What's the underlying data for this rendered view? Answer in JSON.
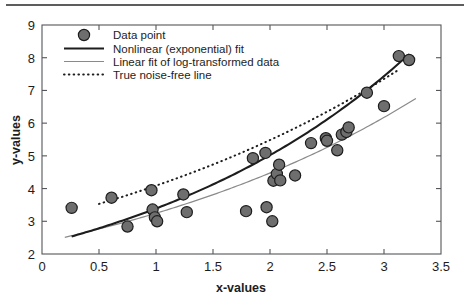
{
  "figure": {
    "width": 470,
    "height": 302,
    "background": "#ffffff",
    "top_rule": "page-separator-rule"
  },
  "chart_data": {
    "type": "scatter",
    "title": "",
    "xlabel": "x-values",
    "ylabel": "y-values",
    "xlim": [
      0,
      3.5
    ],
    "ylim": [
      2,
      9
    ],
    "xticks": [
      0,
      0.5,
      1,
      1.5,
      2,
      2.5,
      3,
      3.5
    ],
    "xticklabels": [
      "0",
      "0.5",
      "1",
      "1.5",
      "2",
      "2.5",
      "3",
      "3.5"
    ],
    "yticks": [
      2,
      3,
      4,
      5,
      6,
      7,
      8,
      9
    ],
    "yticklabels": [
      "2",
      "3",
      "4",
      "5",
      "6",
      "7",
      "8",
      "9"
    ],
    "grid": false,
    "legend_position": "upper left",
    "legend": [
      {
        "label": "Data point",
        "marker": "filled-circle",
        "color": "#6e6e6e",
        "edge": "#1d1d1d"
      },
      {
        "label": "Nonlinear (exponential) fit",
        "style": "solid-thick",
        "color": "#1d1d1d"
      },
      {
        "label": "Linear fit of log-transformed data",
        "style": "solid-thin",
        "color": "#8a8a8a"
      },
      {
        "label": "True noise-free line",
        "style": "dotted",
        "color": "#1d1d1d"
      }
    ],
    "series": [
      {
        "name": "Data point",
        "type": "scatter",
        "marker": "o",
        "color": "#6e6e6e",
        "edgecolor": "#1d1d1d",
        "x": [
          0.26,
          0.61,
          0.75,
          0.96,
          0.97,
          0.99,
          1.01,
          1.24,
          1.27,
          1.79,
          1.85,
          1.96,
          1.97,
          2.02,
          2.03,
          2.06,
          2.08,
          2.09,
          2.22,
          2.36,
          2.49,
          2.5,
          2.59,
          2.63,
          2.67,
          2.69,
          2.85,
          3.0,
          3.13,
          3.22
        ],
        "y": [
          3.41,
          3.72,
          2.84,
          3.95,
          3.36,
          3.12,
          3.0,
          3.82,
          3.28,
          3.31,
          4.93,
          5.09,
          3.43,
          3.0,
          4.24,
          4.45,
          4.73,
          4.25,
          4.4,
          5.39,
          5.54,
          5.46,
          5.17,
          5.65,
          5.73,
          5.87,
          6.93,
          6.52,
          8.05,
          7.93
        ]
      },
      {
        "name": "Nonlinear (exponential) fit",
        "type": "line",
        "style": "solid-thick",
        "color": "#1d1d1d",
        "model": "a*exp(b*x)",
        "a": 2.29,
        "b": 0.3926,
        "x_range": [
          0.26,
          3.22
        ]
      },
      {
        "name": "Linear fit of log-transformed data",
        "type": "line",
        "style": "solid-thin",
        "color": "#8a8a8a",
        "model": "exp(p*x + q)",
        "p": 0.3214,
        "q": 0.8562,
        "x_range": [
          0.2,
          3.28
        ]
      },
      {
        "name": "True noise-free line",
        "type": "line",
        "style": "dotted",
        "color": "#1d1d1d",
        "model": "a*exp(b*x)",
        "a": 3.05,
        "b": 0.2932,
        "x_range": [
          0.5,
          3.14
        ]
      }
    ]
  }
}
